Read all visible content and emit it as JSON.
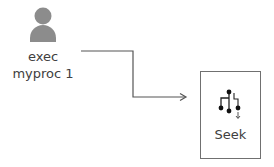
{
  "actor": {
    "icon": "person-icon",
    "label_line1": "exec",
    "label_line2": "myproc 1",
    "icon_color": "#8c8c8c"
  },
  "connector": {
    "type": "elbow-arrow",
    "color": "#555555"
  },
  "target": {
    "icon": "seek-tree-icon",
    "label": "Seek",
    "border_color": "#707070"
  }
}
